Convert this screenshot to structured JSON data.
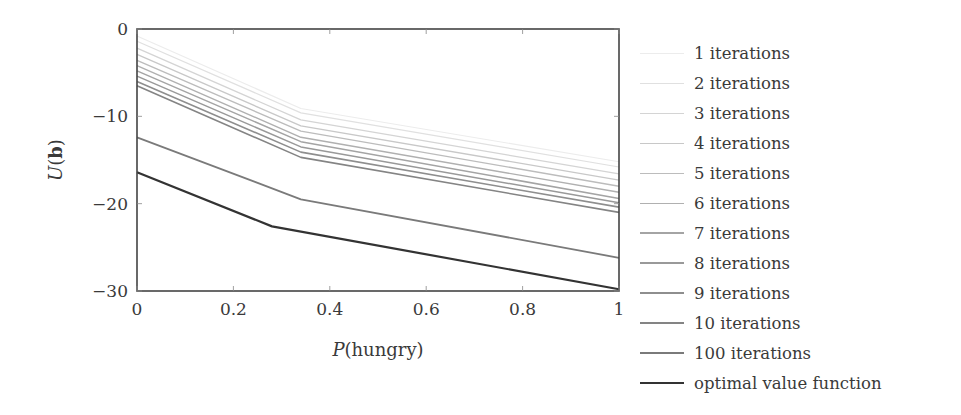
{
  "chart_data": {
    "type": "line",
    "title": "",
    "xlabel": "P(hungry)",
    "ylabel": "U(b)",
    "xlim": [
      0,
      1
    ],
    "ylim": [
      -30,
      0
    ],
    "xticks": [
      0,
      0.2,
      0.4,
      0.6,
      0.8,
      1
    ],
    "xtick_labels": [
      "0",
      "0.2",
      "0.4",
      "0.6",
      "0.8",
      "1"
    ],
    "yticks": [
      0,
      -10,
      -20,
      -30
    ],
    "ytick_labels": [
      "0",
      "−10",
      "−20",
      "−30"
    ],
    "grid": false,
    "legend_position": "outside-right",
    "series": [
      {
        "name": "1 iterations",
        "color": "#ececec",
        "width": 1.2,
        "x": [
          0,
          0.34,
          1
        ],
        "y": [
          -0.8,
          -9.1,
          -15.2
        ]
      },
      {
        "name": "2 iterations",
        "color": "#e0e0e0",
        "width": 1.2,
        "x": [
          0,
          0.34,
          1
        ],
        "y": [
          -1.4,
          -9.6,
          -15.8
        ]
      },
      {
        "name": "3 iterations",
        "color": "#d4d4d4",
        "width": 1.3,
        "x": [
          0,
          0.34,
          1
        ],
        "y": [
          -2.2,
          -10.4,
          -16.6
        ]
      },
      {
        "name": "4 iterations",
        "color": "#c8c8c8",
        "width": 1.3,
        "x": [
          0,
          0.34,
          1
        ],
        "y": [
          -2.9,
          -11.1,
          -17.3
        ]
      },
      {
        "name": "5 iterations",
        "color": "#bcbcbc",
        "width": 1.4,
        "x": [
          0,
          0.34,
          1
        ],
        "y": [
          -3.6,
          -11.7,
          -18.0
        ]
      },
      {
        "name": "6 iterations",
        "color": "#b0b0b0",
        "width": 1.4,
        "x": [
          0,
          0.34,
          1
        ],
        "y": [
          -4.2,
          -12.4,
          -18.7
        ]
      },
      {
        "name": "7 iterations",
        "color": "#a4a4a4",
        "width": 1.5,
        "x": [
          0,
          0.34,
          1
        ],
        "y": [
          -4.8,
          -12.9,
          -19.4
        ]
      },
      {
        "name": "8 iterations",
        "color": "#999999",
        "width": 1.5,
        "x": [
          0,
          0.34,
          1
        ],
        "y": [
          -5.4,
          -13.5,
          -19.9
        ]
      },
      {
        "name": "9 iterations",
        "color": "#8e8e8e",
        "width": 1.6,
        "x": [
          0,
          0.34,
          1
        ],
        "y": [
          -6.0,
          -14.1,
          -20.4
        ]
      },
      {
        "name": "10 iterations",
        "color": "#848484",
        "width": 1.6,
        "x": [
          0,
          0.34,
          1
        ],
        "y": [
          -6.5,
          -14.7,
          -21.0
        ]
      },
      {
        "name": "100 iterations",
        "color": "#7a7a7a",
        "width": 1.8,
        "x": [
          0,
          0.34,
          1
        ],
        "y": [
          -12.4,
          -19.5,
          -26.2
        ]
      },
      {
        "name": "optimal value function",
        "color": "#333333",
        "width": 2.2,
        "x": [
          0,
          0.28,
          1
        ],
        "y": [
          -16.4,
          -22.6,
          -29.8
        ]
      }
    ]
  }
}
